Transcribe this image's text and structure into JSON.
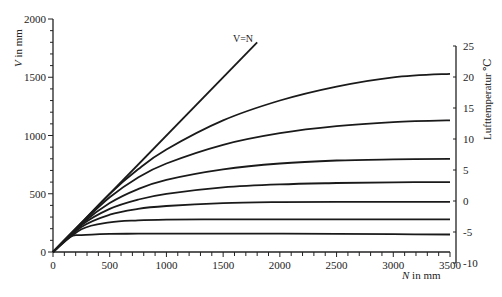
{
  "chart_data": {
    "type": "line",
    "title": "",
    "xlabel": "N in mm",
    "ylabel": "V in mm",
    "y2label": "Lufttemperatur ℃",
    "xlim": [
      0,
      3500
    ],
    "ylim": [
      0,
      2000
    ],
    "y2lim": [
      -10,
      25
    ],
    "grid": false,
    "x_ticks": [
      0,
      500,
      1000,
      1500,
      2000,
      2500,
      3000,
      3500
    ],
    "y_ticks": [
      0,
      500,
      1000,
      1500,
      2000
    ],
    "y2_ticks": [
      25,
      20,
      15,
      10,
      5,
      0,
      -5,
      -10
    ],
    "reference_line": {
      "label": "V=N",
      "x": [
        0,
        1800
      ],
      "y": [
        0,
        1800
      ]
    },
    "series": [
      {
        "name": "25 ℃",
        "x": [
          0,
          250,
          500,
          750,
          1000,
          1500,
          2000,
          2500,
          3000,
          3500
        ],
        "y": [
          0,
          250,
          500,
          710,
          880,
          1130,
          1300,
          1420,
          1500,
          1530
        ]
      },
      {
        "name": "20 ℃",
        "x": [
          0,
          250,
          500,
          750,
          1000,
          1500,
          2000,
          2500,
          3000,
          3500
        ],
        "y": [
          0,
          245,
          470,
          640,
          760,
          920,
          1020,
          1080,
          1115,
          1130
        ]
      },
      {
        "name": "15 ℃",
        "x": [
          0,
          250,
          500,
          750,
          1000,
          1500,
          2000,
          2500,
          3000,
          3500
        ],
        "y": [
          0,
          240,
          420,
          540,
          620,
          710,
          760,
          785,
          795,
          800
        ]
      },
      {
        "name": "10 ℃",
        "x": [
          0,
          250,
          500,
          750,
          1000,
          1500,
          2000,
          2500,
          3000,
          3500
        ],
        "y": [
          0,
          230,
          370,
          450,
          500,
          555,
          580,
          592,
          598,
          600
        ]
      },
      {
        "name": "5 ℃",
        "x": [
          0,
          250,
          500,
          750,
          1000,
          1500,
          2000,
          2500,
          3000,
          3500
        ],
        "y": [
          0,
          215,
          320,
          370,
          395,
          420,
          428,
          430,
          430,
          430
        ]
      },
      {
        "name": "0 ℃",
        "x": [
          0,
          250,
          500,
          750,
          1000,
          1500,
          2000,
          2500,
          3000,
          3500
        ],
        "y": [
          0,
          195,
          255,
          272,
          278,
          280,
          280,
          280,
          280,
          280
        ]
      },
      {
        "name": "-5 ℃",
        "x": [
          0,
          150,
          250,
          500,
          750,
          1000,
          1500,
          2000,
          2500,
          3000,
          3500
        ],
        "y": [
          0,
          130,
          145,
          155,
          157,
          158,
          158,
          157,
          155,
          153,
          150
        ]
      }
    ]
  }
}
